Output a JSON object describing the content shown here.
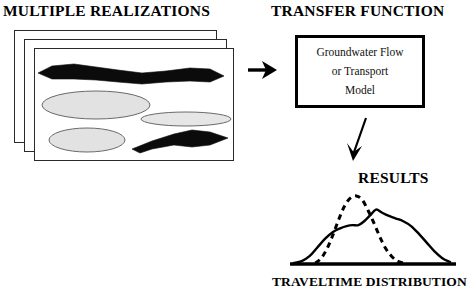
{
  "figure": {
    "headings": {
      "realizations": "MULTIPLE REALIZATIONS",
      "transfer": "TRANSFER FUNCTION",
      "results": "RESULTS",
      "traveltime_caption": "TRAVELTIME DISTRIBUTION"
    },
    "transfer_box": {
      "line1": "Groundwater Flow",
      "line2": "or Transport",
      "line3": "Model"
    },
    "arrows": [
      {
        "name": "arrow-right",
        "direction": "right"
      },
      {
        "name": "arrow-down",
        "direction": "down-left"
      }
    ],
    "realization_panels": {
      "count": 3,
      "facies": {
        "channel_bands": 2,
        "lens_ellipses": 3
      },
      "colors": {
        "panel_fill": "#ffffff",
        "panel_border": "#2a2a2a",
        "channel_fill": "#0b0b0b",
        "lens_fill": "#e2e2e2",
        "lens_stroke": "#6a6a6a"
      }
    },
    "colors": {
      "ink": "#000000",
      "background": "#ffffff"
    }
  },
  "chart_data": {
    "type": "line",
    "title": "RESULTS",
    "xlabel": "TRAVELTIME DISTRIBUTION",
    "ylabel": "",
    "grid": false,
    "legend": "none",
    "axis": {
      "baseline": true,
      "x_axis_only": true
    },
    "xlim": [
      0,
      170
    ],
    "ylim": [
      0,
      72
    ],
    "series": [
      {
        "name": "broad distribution",
        "style": "solid",
        "color": "#000000",
        "x": [
          4,
          12,
          20,
          28,
          36,
          44,
          52,
          58,
          64,
          70,
          76,
          82,
          88,
          94,
          100,
          108,
          116,
          124,
          132,
          140,
          148,
          156,
          164
        ],
        "y": [
          1,
          3,
          8,
          17,
          26,
          33,
          37,
          39,
          40,
          40,
          44,
          50,
          56,
          53,
          50,
          47,
          44,
          39,
          31,
          22,
          13,
          6,
          2
        ]
      },
      {
        "name": "narrow distribution",
        "style": "dashed",
        "color": "#000000",
        "x": [
          26,
          32,
          38,
          44,
          50,
          56,
          62,
          68,
          74,
          80,
          86,
          92,
          98,
          104,
          110,
          116
        ],
        "y": [
          1,
          6,
          16,
          30,
          46,
          60,
          68,
          70,
          66,
          55,
          42,
          28,
          16,
          8,
          3,
          1
        ]
      }
    ]
  }
}
